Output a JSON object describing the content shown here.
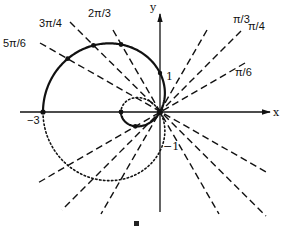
{
  "diagram": {
    "type": "polar-curve",
    "equation_shown": "",
    "curve": "r = 1 - 2cos(theta)",
    "axes": {
      "x_label": "x",
      "y_label": "y"
    },
    "tick_labels": {
      "neg3": "−3",
      "one": "1",
      "neg1": "−1"
    },
    "angle_labels": {
      "pi6": "π/6",
      "pi4": "π/4",
      "pi3": "π/3",
      "twopi3": "2π/3",
      "threepi4": "3π/4",
      "fivepi6": "5π/6"
    },
    "marked_angles": [
      "0",
      "π/6",
      "π/3",
      "π/2",
      "2π/3",
      "3π/4",
      "5π/6",
      "π"
    ],
    "solid_portion": "0 ≤ θ ≤ π",
    "dotted_portion": "π ≤ θ ≤ 2π",
    "bottom_fragment": "‒"
  }
}
